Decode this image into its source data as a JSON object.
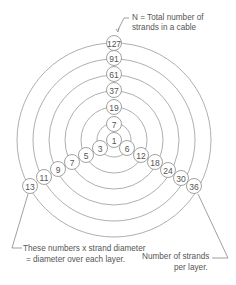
{
  "diagram": {
    "type": "concentric-strand-layers",
    "center": [
      114,
      140
    ],
    "rings": [
      {
        "r": 97
      },
      {
        "r": 81
      },
      {
        "r": 65
      },
      {
        "r": 49
      },
      {
        "r": 33
      },
      {
        "r": 17
      }
    ],
    "total_strands": [
      {
        "label": "127",
        "x": 114,
        "y": 43
      },
      {
        "label": "91",
        "x": 114,
        "y": 58
      },
      {
        "label": "61",
        "x": 114,
        "y": 74
      },
      {
        "label": "37",
        "x": 114,
        "y": 90
      },
      {
        "label": "19",
        "x": 114,
        "y": 107
      },
      {
        "label": "7",
        "x": 114,
        "y": 124
      },
      {
        "label": "1",
        "x": 114,
        "y": 140
      }
    ],
    "diameter_multipliers": [
      {
        "label": "3",
        "x": 100,
        "y": 148
      },
      {
        "label": "5",
        "x": 86,
        "y": 155
      },
      {
        "label": "7",
        "x": 72,
        "y": 162
      },
      {
        "label": "9",
        "x": 58,
        "y": 169
      },
      {
        "label": "11",
        "x": 44,
        "y": 177
      },
      {
        "label": "13",
        "x": 30,
        "y": 186
      }
    ],
    "strands_per_layer": [
      {
        "label": "6",
        "x": 127,
        "y": 148
      },
      {
        "label": "12",
        "x": 141,
        "y": 155
      },
      {
        "label": "18",
        "x": 155,
        "y": 162
      },
      {
        "label": "24",
        "x": 168,
        "y": 170
      },
      {
        "label": "30",
        "x": 181,
        "y": 178
      },
      {
        "label": "36",
        "x": 194,
        "y": 186
      }
    ]
  },
  "annotations": {
    "top_line1": "N = Total number of",
    "top_line2": "strands in a cable",
    "left_line1": "These numbers x strand diameter",
    "left_line2": "= diameter over each layer.",
    "right_line1": "Number of strands",
    "right_line2": "per layer."
  }
}
